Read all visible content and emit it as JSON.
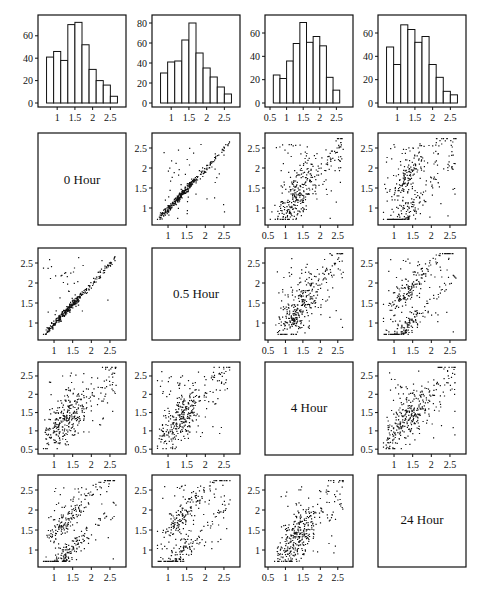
{
  "chart_data": {
    "type": "scatter-matrix",
    "title": "",
    "variables": [
      "0 Hour",
      "0.5 Hour",
      "4 Hour",
      "24 Hour"
    ],
    "diagonal_labels": [
      "0 Hour",
      "0.5 Hour",
      "4 Hour",
      "24 Hour"
    ],
    "histograms": [
      {
        "variable": "0 Hour",
        "bin_edges": [
          0.7,
          0.9,
          1.1,
          1.3,
          1.5,
          1.7,
          1.9,
          2.1,
          2.3,
          2.5,
          2.7
        ],
        "counts": [
          41,
          46,
          38,
          70,
          72,
          52,
          30,
          20,
          16,
          6
        ],
        "yticks": [
          0,
          20,
          40,
          60
        ],
        "ylim": [
          0,
          75
        ],
        "xticks": [
          1,
          1.5,
          2,
          2.5
        ],
        "xlim": [
          0.6,
          2.8
        ]
      },
      {
        "variable": "0.5 Hour",
        "bin_edges": [
          0.7,
          0.9,
          1.1,
          1.3,
          1.5,
          1.7,
          1.9,
          2.1,
          2.3,
          2.5,
          2.7
        ],
        "counts": [
          30,
          41,
          42,
          63,
          80,
          50,
          35,
          26,
          16,
          9
        ],
        "yticks": [
          0,
          20,
          40,
          60,
          80
        ],
        "ylim": [
          0,
          84
        ],
        "xticks": [
          1,
          1.5,
          2,
          2.5
        ],
        "xlim": [
          0.6,
          2.8
        ]
      },
      {
        "variable": "4 Hour",
        "bin_edges": [
          0.6,
          0.8,
          1.0,
          1.2,
          1.4,
          1.6,
          1.8,
          2.0,
          2.2,
          2.4,
          2.6,
          2.8
        ],
        "counts": [
          24,
          21,
          36,
          51,
          69,
          52,
          57,
          49,
          22,
          11
        ],
        "yticks": [
          0,
          20,
          40,
          60
        ],
        "ylim": [
          0,
          72
        ],
        "xticks": [
          0.5,
          1,
          1.5,
          2,
          2.5
        ],
        "xlim": [
          0.5,
          2.85
        ]
      },
      {
        "variable": "24 Hour",
        "bin_edges": [
          0.7,
          0.9,
          1.1,
          1.3,
          1.5,
          1.7,
          1.9,
          2.1,
          2.3,
          2.5,
          2.7
        ],
        "counts": [
          48,
          33,
          67,
          63,
          52,
          57,
          33,
          22,
          10,
          7
        ],
        "yticks": [
          0,
          20,
          40,
          60
        ],
        "ylim": [
          0,
          72
        ],
        "xticks": [
          1,
          1.5,
          2,
          2.5
        ],
        "xlim": [
          0.6,
          2.8
        ]
      }
    ],
    "scatter_panels": [
      {
        "row": "0 Hour",
        "col": "0.5 Hour",
        "correlation": "very strong positive (near y=x)",
        "xticks": [
          1,
          1.5,
          2,
          2.5
        ],
        "yticks": [
          1,
          1.5,
          2,
          2.5
        ]
      },
      {
        "row": "0 Hour",
        "col": "4 Hour",
        "correlation": "moderate positive",
        "xticks": [
          0.5,
          1,
          1.5,
          2,
          2.5
        ],
        "yticks": [
          1,
          1.5,
          2,
          2.5
        ]
      },
      {
        "row": "0 Hour",
        "col": "24 Hour",
        "correlation": "weak positive, two clusters",
        "xticks": [
          1,
          1.5,
          2,
          2.5
        ],
        "yticks": [
          1,
          1.5,
          2,
          2.5
        ]
      },
      {
        "row": "0.5 Hour",
        "col": "0 Hour",
        "correlation": "very strong positive (near y=x)",
        "xticks": [
          1,
          1.5,
          2,
          2.5
        ],
        "yticks": [
          1,
          1.5,
          2,
          2.5
        ]
      },
      {
        "row": "0.5 Hour",
        "col": "4 Hour",
        "correlation": "moderate positive",
        "xticks": [
          0.5,
          1,
          1.5,
          2,
          2.5
        ],
        "yticks": [
          1,
          1.5,
          2,
          2.5
        ]
      },
      {
        "row": "0.5 Hour",
        "col": "24 Hour",
        "correlation": "weak positive, two bands",
        "xticks": [
          1,
          1.5,
          2,
          2.5
        ],
        "yticks": [
          1,
          1.5,
          2,
          2.5
        ]
      },
      {
        "row": "4 Hour",
        "col": "0 Hour",
        "correlation": "moderate positive",
        "xticks": [
          1,
          1.5,
          2,
          2.5
        ],
        "yticks": [
          0.5,
          1,
          1.5,
          2,
          2.5
        ]
      },
      {
        "row": "4 Hour",
        "col": "0.5 Hour",
        "correlation": "moderate positive",
        "xticks": [
          1,
          1.5,
          2,
          2.5
        ],
        "yticks": [
          0.5,
          1,
          1.5,
          2,
          2.5
        ]
      },
      {
        "row": "4 Hour",
        "col": "24 Hour",
        "correlation": "moderate positive",
        "xticks": [
          1,
          1.5,
          2,
          2.5
        ],
        "yticks": [
          0.5,
          1,
          1.5,
          2,
          2.5
        ]
      },
      {
        "row": "24 Hour",
        "col": "0 Hour",
        "correlation": "weak positive, two bands",
        "xticks": [
          1,
          1.5,
          2,
          2.5
        ],
        "yticks": [
          1,
          1.5,
          2,
          2.5
        ]
      },
      {
        "row": "24 Hour",
        "col": "0.5 Hour",
        "correlation": "weak positive, two bands",
        "xticks": [
          1,
          1.5,
          2,
          2.5
        ],
        "yticks": [
          1,
          1.5,
          2,
          2.5
        ]
      },
      {
        "row": "24 Hour",
        "col": "4 Hour",
        "correlation": "moderate positive",
        "xticks": [
          0.5,
          1,
          1.5,
          2,
          2.5
        ],
        "yticks": [
          1,
          1.5,
          2,
          2.5
        ]
      }
    ],
    "xlabel": "",
    "ylabel": "",
    "grid": false,
    "legend": null
  },
  "panels": {
    "diag": {
      "d0": "0 Hour",
      "d1": "0.5 Hour",
      "d2": "4 Hour",
      "d3": "24 Hour"
    }
  }
}
